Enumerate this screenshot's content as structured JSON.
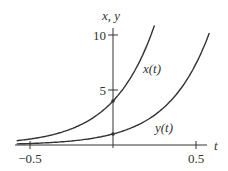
{
  "chart_data": {
    "type": "line",
    "title": "",
    "xlabel": "t",
    "ylabel": "x, y",
    "xlim": [
      -0.55,
      0.55
    ],
    "ylim": [
      0,
      10.5
    ],
    "x_ticks": [
      -0.5,
      0.5
    ],
    "x_tick_labels": [
      "−0.5",
      "0.5"
    ],
    "y_ticks": [
      5,
      10
    ],
    "y_tick_labels": [
      "5",
      "10"
    ],
    "grid": false,
    "series": [
      {
        "name": "x(t)",
        "formula": "4e^{4t}",
        "x": [
          -0.55,
          -0.5,
          -0.25,
          0,
          0.1,
          0.2,
          0.25
        ],
        "values": [
          0.44,
          0.54,
          1.47,
          4.0,
          5.97,
          8.9,
          10.9
        ],
        "label": "x(t)"
      },
      {
        "name": "y(t)",
        "formula": "e^{4t}",
        "x": [
          -0.55,
          -0.5,
          -0.25,
          0,
          0.25,
          0.4,
          0.58
        ],
        "values": [
          0.11,
          0.14,
          0.37,
          1.0,
          2.72,
          4.95,
          10.2
        ],
        "label": "y(t)"
      }
    ],
    "annotations": [
      {
        "text": "x(t)",
        "near": "upper curve"
      },
      {
        "text": "y(t)",
        "near": "lower curve"
      }
    ],
    "marked_points": [
      {
        "t": 0,
        "value": 4
      },
      {
        "t": 0,
        "value": 1
      }
    ]
  }
}
